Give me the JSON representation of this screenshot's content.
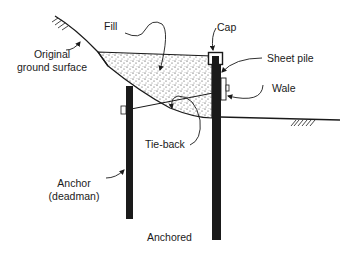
{
  "diagram": {
    "caption": "Anchored",
    "labels": {
      "fill": "Fill",
      "cap": "Cap",
      "original_ground_line1": "Original",
      "original_ground_line2": "ground surface",
      "sheet_pile": "Sheet pile",
      "wale": "Wale",
      "tie_back": "Tie-back",
      "anchor_line1": "Anchor",
      "anchor_line2": "(deadman)"
    },
    "colors": {
      "ink": "#1a1a1a",
      "background": "#ffffff"
    }
  }
}
